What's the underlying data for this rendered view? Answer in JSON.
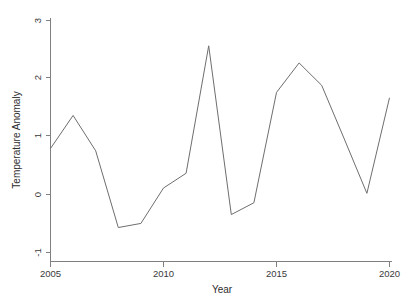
{
  "chart_data": {
    "type": "line",
    "title": "",
    "xlabel": "Year",
    "ylabel": "Temperature Anomaly",
    "xlim": [
      2004.6,
      2020.4
    ],
    "ylim": [
      -1.15,
      3.1
    ],
    "xticks": [
      2005,
      2010,
      2015,
      2020
    ],
    "xtick_labels": [
      "2005",
      "2010",
      "2015",
      "2020"
    ],
    "yticks": [
      -1,
      0,
      1,
      2,
      3
    ],
    "ytick_labels": [
      "-1",
      "0",
      "1",
      "2",
      "3"
    ],
    "grid": false,
    "legend": false,
    "line_color": "#6e6e6e",
    "series": [
      {
        "name": "Temperature Anomaly",
        "x": [
          2005,
          2006,
          2007,
          2008,
          2009,
          2010,
          2011,
          2012,
          2013,
          2014,
          2015,
          2016,
          2017,
          2018,
          2019,
          2020
        ],
        "values": [
          0.78,
          1.34,
          0.74,
          -0.56,
          -0.49,
          0.11,
          0.36,
          2.52,
          -0.34,
          -0.14,
          1.73,
          2.23,
          1.85,
          0.94,
          0.02,
          1.64
        ]
      }
    ]
  },
  "axes": {
    "x_axis_label": "Year",
    "y_axis_label": "Temperature Anomaly"
  }
}
